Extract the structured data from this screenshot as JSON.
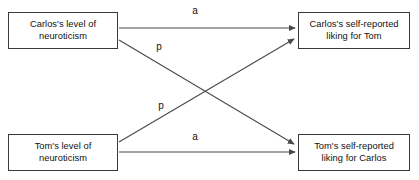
{
  "diagram": {
    "type": "path-diagram",
    "nodes": [
      {
        "id": "carlos-neuroticism",
        "label": "Carlos's level of\nneuroticism",
        "role": "predictor",
        "position": "top-left"
      },
      {
        "id": "carlos-liking",
        "label": "Carlos's self-reported\nliking for Tom",
        "role": "outcome",
        "position": "top-right"
      },
      {
        "id": "tom-neuroticism",
        "label": "Tom's level of\nneuroticism",
        "role": "predictor",
        "position": "bottom-left"
      },
      {
        "id": "tom-liking",
        "label": "Tom's self-reported\nliking for Carlos",
        "role": "outcome",
        "position": "bottom-right"
      }
    ],
    "paths": [
      {
        "id": "actor-carlos",
        "label": "a",
        "effect": "actor",
        "from": "carlos-neuroticism",
        "to": "carlos-liking",
        "style": "horizontal-arrow"
      },
      {
        "id": "partner-carlos-to-tom",
        "label": "p",
        "effect": "partner",
        "from": "carlos-neuroticism",
        "to": "tom-liking",
        "style": "diagonal-arrow"
      },
      {
        "id": "partner-tom-to-carlos",
        "label": "p",
        "effect": "partner",
        "from": "tom-neuroticism",
        "to": "carlos-liking",
        "style": "diagonal-arrow"
      },
      {
        "id": "actor-tom",
        "label": "a",
        "effect": "actor",
        "from": "tom-neuroticism",
        "to": "tom-liking",
        "style": "horizontal-arrow"
      }
    ],
    "colors": {
      "box_border": "#3a3a3a",
      "arrow": "#4a4a4a",
      "text": "#111111",
      "background": "#ffffff"
    }
  }
}
